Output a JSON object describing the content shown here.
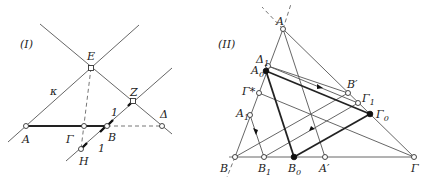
{
  "panel_I": {
    "title": "(I)",
    "labels": {
      "E": "E",
      "kappa": "κ",
      "Z": "Z",
      "one_top": "1",
      "Delta": "Δ",
      "A": "A",
      "Gamma": "Γ",
      "B": "B",
      "one_bottom": "1",
      "H": "H"
    }
  },
  "panel_II": {
    "title": "(II)",
    "labels": {
      "A": "A",
      "Delta1": "Δ",
      "Delta1_sub": "1",
      "A0": "A",
      "A0_sub": "0",
      "GammaStar": "Γ*",
      "A1": "A",
      "A1_sub": "1",
      "Bprime": "B′",
      "Gamma1": "Γ",
      "Gamma1_sub": "1",
      "Gamma0": "Γ",
      "Gamma0_sub": "0",
      "B": "B",
      "B1": "B",
      "B1_sub": "1",
      "B0": "B",
      "B0_sub": "0",
      "Aprime": "A′",
      "Gamma": "Γ"
    }
  }
}
